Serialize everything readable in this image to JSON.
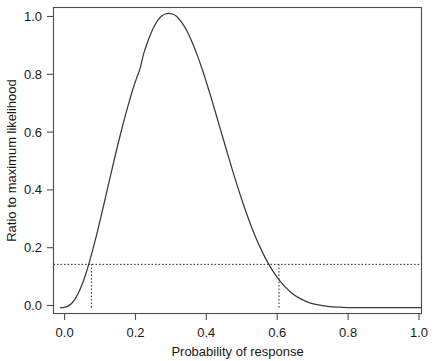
{
  "chart_data": {
    "type": "line",
    "title": "",
    "subtitle": "",
    "xlabel": "Probability of response",
    "ylabel": "Ratio to maximum likelihood",
    "xlim": [
      -0.02,
      1.0
    ],
    "ylim": [
      -0.02,
      1.02
    ],
    "xticks": [
      0.0,
      0.2,
      0.4,
      0.6,
      0.8,
      1.0
    ],
    "xtick_labels": [
      "0.0",
      "0.2",
      "0.4",
      "0.6",
      "0.8",
      "1.0"
    ],
    "yticks": [
      0.0,
      0.2,
      0.4,
      0.6,
      0.8,
      1.0
    ],
    "ytick_labels": [
      "0.0",
      "0.2",
      "0.4",
      "0.6",
      "0.8",
      "1.0"
    ],
    "grid": false,
    "legend": null,
    "frame": "box",
    "series": [
      {
        "name": "Relative likelihood",
        "color": "#3a3a3a",
        "style": "solid",
        "x": [
          0.0,
          0.01,
          0.02,
          0.03,
          0.04,
          0.05,
          0.06,
          0.07,
          0.08,
          0.09,
          0.1,
          0.11,
          0.12,
          0.13,
          0.14,
          0.15,
          0.16,
          0.17,
          0.18,
          0.19,
          0.2,
          0.21,
          0.22,
          0.23,
          0.24,
          0.25,
          0.26,
          0.27,
          0.28,
          0.29,
          0.3,
          0.31,
          0.32,
          0.33,
          0.34,
          0.35,
          0.36,
          0.37,
          0.38,
          0.39,
          0.4,
          0.42,
          0.44,
          0.46,
          0.48,
          0.5,
          0.52,
          0.54,
          0.56,
          0.58,
          0.6,
          0.62,
          0.64,
          0.66,
          0.68,
          0.7,
          0.74,
          0.78,
          0.82,
          0.86,
          0.9,
          0.94,
          0.98,
          1.0
        ],
        "y": [
          0.0,
          0.001,
          0.005,
          0.014,
          0.03,
          0.052,
          0.081,
          0.116,
          0.157,
          0.202,
          0.25,
          0.301,
          0.353,
          0.406,
          0.459,
          0.511,
          0.562,
          0.611,
          0.657,
          0.701,
          0.742,
          0.779,
          0.813,
          0.863,
          0.9,
          0.932,
          0.958,
          0.978,
          0.991,
          0.998,
          1.0,
          0.998,
          0.991,
          0.978,
          0.961,
          0.94,
          0.914,
          0.885,
          0.853,
          0.818,
          0.781,
          0.701,
          0.617,
          0.533,
          0.451,
          0.374,
          0.303,
          0.24,
          0.186,
          0.14,
          0.103,
          0.073,
          0.05,
          0.033,
          0.021,
          0.013,
          0.004,
          0.001,
          0.0,
          0.0,
          0.0,
          0.0,
          0.0,
          0.0
        ]
      }
    ],
    "annotations": {
      "horizontal_reference": {
        "name": "likelihood-threshold",
        "y": 0.147,
        "style": "dotted",
        "x_from": -0.02,
        "x_to": 1.0
      },
      "vertical_references": [
        {
          "name": "lower-limit",
          "x": 0.085,
          "style": "dotted",
          "y_from": 0.0,
          "y_to": 0.147
        },
        {
          "name": "upper-limit",
          "x": 0.605,
          "style": "dotted",
          "y_from": 0.0,
          "y_to": 0.147
        }
      ],
      "maximum": {
        "x": 0.3,
        "y": 1.0
      }
    }
  },
  "axes": {
    "x_title": "Probability of response",
    "y_title": "Ratio to maximum likelihood"
  }
}
